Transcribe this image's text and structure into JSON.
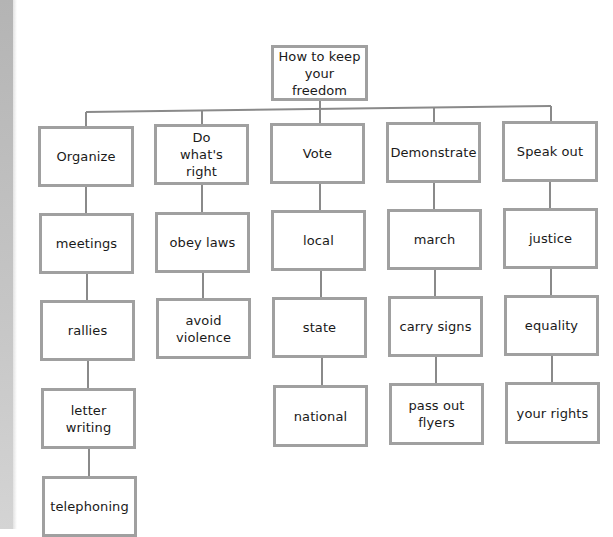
{
  "title": "How to keep your freedom",
  "root": {
    "label": "How to keep your freedom",
    "line1": "How to keep",
    "line2": "your freedom"
  },
  "branches": [
    {
      "label": "Organize",
      "children": [
        "meetings",
        "rallies",
        "letter writing",
        "telephoning"
      ]
    },
    {
      "label": "Do what's right",
      "children": [
        "obey laws",
        "avoid violence"
      ]
    },
    {
      "label": "Vote",
      "children": [
        "local",
        "state",
        "national"
      ]
    },
    {
      "label": "Demonstrate",
      "children": [
        "march",
        "carry signs",
        "pass out flyers"
      ]
    },
    {
      "label": "Speak out",
      "children": [
        "justice",
        "equality",
        "your rights"
      ]
    }
  ],
  "colors": {
    "border": "#a0a0a0",
    "line": "#8a8a8a",
    "text": "#1a1a1a"
  }
}
